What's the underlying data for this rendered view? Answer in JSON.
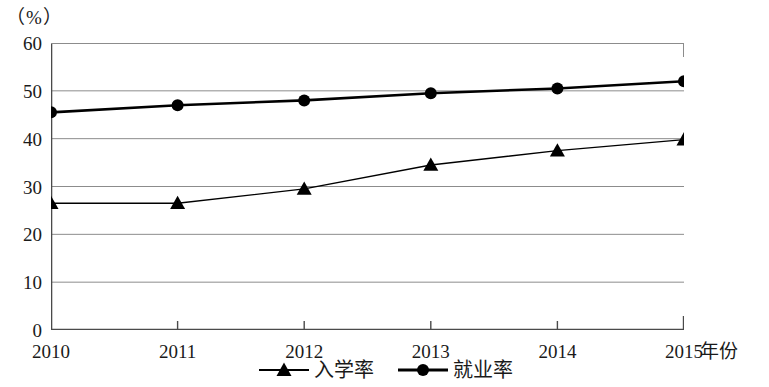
{
  "chart_data": {
    "type": "line",
    "title": "",
    "subtitle": "",
    "unit_label": "（%）",
    "xlabel": "年份",
    "ylabel": "",
    "categories": [
      "2010",
      "2011",
      "2012",
      "2013",
      "2014",
      "2015"
    ],
    "x": [
      2010,
      2011,
      2012,
      2013,
      2014,
      2015
    ],
    "xlim": [
      2010,
      2015
    ],
    "ylim": [
      0,
      60
    ],
    "yticks": [
      0,
      10,
      20,
      30,
      40,
      50,
      60
    ],
    "ytick_labels": [
      "0",
      "10",
      "20",
      "30",
      "40",
      "50",
      "60"
    ],
    "xtick_labels": [
      "2010",
      "2011",
      "2012",
      "2013",
      "2014",
      "2015"
    ],
    "grid": true,
    "grid_axis": "y",
    "grid_color": "#8c8c8c",
    "legend_position": "bottom-center",
    "series": [
      {
        "name": "入学率",
        "marker": "triangle",
        "color": "#000000",
        "line_width": 1.4,
        "values": [
          26.5,
          26.5,
          29.5,
          34.5,
          37.5,
          39.8
        ]
      },
      {
        "name": "就业率",
        "marker": "circle",
        "color": "#000000",
        "line_width": 2.6,
        "values": [
          45.5,
          47.0,
          48.0,
          49.5,
          50.5,
          52.0
        ]
      }
    ]
  },
  "legend": {
    "entries": [
      {
        "label": "入学率",
        "marker": "triangle-marker-icon"
      },
      {
        "label": "就业率",
        "marker": "circle-marker-icon"
      }
    ]
  },
  "axes": {
    "unit": "（%）",
    "x_title": "年份"
  }
}
